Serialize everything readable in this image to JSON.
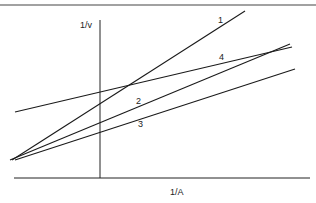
{
  "diagram": {
    "type": "double-reciprocal (Lineweaver-Burk) plot",
    "y_axis_label": "1/v",
    "x_axis_label": "1/A",
    "line_color": "#1a1a1a",
    "lines": [
      {
        "id": "1",
        "label": "1",
        "x1": 12,
        "y1": 160,
        "x2": 245,
        "y2": 11,
        "label_x": 218,
        "label_y": 23
      },
      {
        "id": "2",
        "label": "2",
        "x1": 10,
        "y1": 160,
        "x2": 290,
        "y2": 44,
        "label_x": 136,
        "label_y": 104
      },
      {
        "id": "3",
        "label": "3",
        "x1": 15,
        "y1": 160,
        "x2": 295,
        "y2": 69,
        "label_x": 138,
        "label_y": 127
      },
      {
        "id": "4",
        "label": "4",
        "x1": 15,
        "y1": 112,
        "x2": 292,
        "y2": 47,
        "label_x": 219,
        "label_y": 60
      }
    ]
  }
}
